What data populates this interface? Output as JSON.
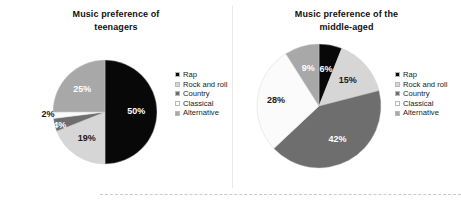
{
  "figure": {
    "background_color": "#ffffff",
    "divider_color": "#e9e9e9",
    "bottom_rule_style": "dashed"
  },
  "palette": {
    "rap": "#080808",
    "rock_and_roll": "#d6d6d6",
    "country": "#6e6e6e",
    "classical": "#fbfbfb",
    "alternative": "#a8a8a8"
  },
  "legend": {
    "entries": [
      {
        "label": "Rap",
        "color": "#080808"
      },
      {
        "label": "Rock and roll",
        "color": "#d6d6d6"
      },
      {
        "label": "Country",
        "color": "#6e6e6e"
      },
      {
        "label": "Classical",
        "color": "#fbfbfb"
      },
      {
        "label": "Alternative",
        "color": "#a8a8a8"
      }
    ]
  },
  "chart_data": [
    {
      "type": "pie",
      "id": "teenagers",
      "title": "Music preference of teenagers",
      "xlabel": "",
      "ylabel": "",
      "legend_position": "right",
      "start_angle_deg": 0,
      "direction": "clockwise",
      "categories": [
        "Rap",
        "Rock and roll",
        "Country",
        "Classical",
        "Alternative"
      ],
      "values": [
        50,
        19,
        4,
        2,
        25
      ],
      "labels": [
        "50%",
        "19%",
        "4%",
        "2%",
        "25%"
      ],
      "colors": [
        "#080808",
        "#d6d6d6",
        "#6e6e6e",
        "#fbfbfb",
        "#a8a8a8"
      ],
      "label_colors": [
        "#ffffff",
        "#1a1a1a",
        "#ffffff",
        "#1a1a1a",
        "#ffffff"
      ],
      "units": "percent",
      "total": 100
    },
    {
      "type": "pie",
      "id": "middle-aged",
      "title": "Music preference of the middle-aged",
      "xlabel": "",
      "ylabel": "",
      "legend_position": "right",
      "start_angle_deg": 0,
      "direction": "clockwise",
      "categories": [
        "Rap",
        "Rock and roll",
        "Country",
        "Classical",
        "Alternative"
      ],
      "values": [
        6,
        15,
        42,
        28,
        9
      ],
      "labels": [
        "6%",
        "15%",
        "42%",
        "28%",
        "9%"
      ],
      "colors": [
        "#080808",
        "#d6d6d6",
        "#6e6e6e",
        "#fbfbfb",
        "#a8a8a8"
      ],
      "label_colors": [
        "#ffffff",
        "#1a1a1a",
        "#ffffff",
        "#1a1a1a",
        "#ffffff"
      ],
      "units": "percent",
      "total": 100
    }
  ],
  "charts": {
    "teenagers": {
      "title_line1": "Music preference of",
      "title_line2": "teenagers"
    },
    "middleaged": {
      "title_line1": "Music preference of the",
      "title_line2": "middle-aged"
    }
  }
}
